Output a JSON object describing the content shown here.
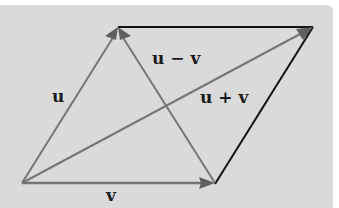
{
  "diagram": {
    "type": "vector-parallelogram",
    "background_color": "#dadada",
    "colors": {
      "vector": "#707070",
      "edge": "#111111",
      "arrowhead": "#606060"
    },
    "points": {
      "origin": [
        22,
        183
      ],
      "u_tip": [
        118,
        28
      ],
      "v_tip": [
        215,
        183
      ],
      "sum_tip": [
        313,
        27
      ]
    },
    "labels": {
      "u": "u",
      "v": "v",
      "u_minus_v": "u − v",
      "u_plus_v": "u + v"
    }
  }
}
